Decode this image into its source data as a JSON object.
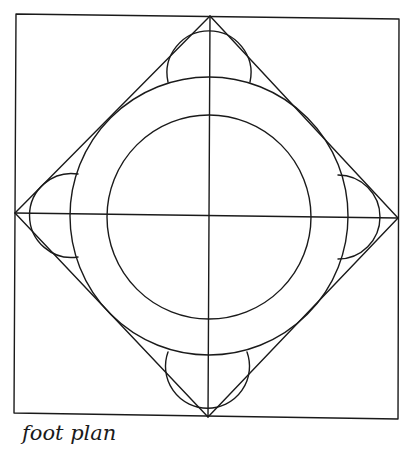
{
  "caption": "foot plan",
  "colors": {
    "stroke": "#1a1a1a",
    "background": "#ffffff"
  },
  "figure": {
    "type": "geometric construction plan",
    "frame_square": {
      "corners": [
        [
          16,
          14
        ],
        [
          399,
          19
        ],
        [
          398,
          419
        ],
        [
          14,
          413
        ]
      ]
    },
    "diamond": {
      "vertices": {
        "top": [
          210,
          16
        ],
        "right": [
          398,
          218
        ],
        "bottom": [
          208,
          417
        ],
        "left": [
          15,
          213
        ]
      }
    },
    "axes": {
      "horizontal": [
        [
          15,
          213
        ],
        [
          398,
          218
        ]
      ],
      "vertical": [
        [
          210,
          16
        ],
        [
          208,
          417
        ]
      ]
    },
    "center": [
      209,
      216
    ],
    "outer_circle": {
      "cx": 209,
      "cy": 216,
      "r": 139
    },
    "inner_circle": {
      "cx": 209,
      "cy": 217,
      "r": 102
    },
    "lobes": [
      {
        "position": "top",
        "cx": 209,
        "cy": 78,
        "r": 42,
        "from": [
          168,
          82
        ],
        "to": [
          250,
          82
        ]
      },
      {
        "position": "right",
        "cx": 341,
        "cy": 217,
        "r": 42,
        "from": [
          338,
          175
        ],
        "to": [
          338,
          259
        ]
      },
      {
        "position": "bottom",
        "cx": 208,
        "cy": 355,
        "r": 42,
        "from": [
          247,
          352
        ],
        "to": [
          168,
          352
        ]
      },
      {
        "position": "left",
        "cx": 76,
        "cy": 215,
        "r": 42,
        "from": [
          78,
          257
        ],
        "to": [
          78,
          174
        ]
      }
    ]
  }
}
